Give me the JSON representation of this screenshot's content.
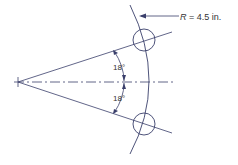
{
  "diagram": {
    "radius_label": {
      "var": "R",
      "text": " = 4.5 in."
    },
    "angle_upper": "18°",
    "angle_lower": "18°",
    "colors": {
      "line": "#3a3f6b",
      "text": "#333333"
    }
  }
}
